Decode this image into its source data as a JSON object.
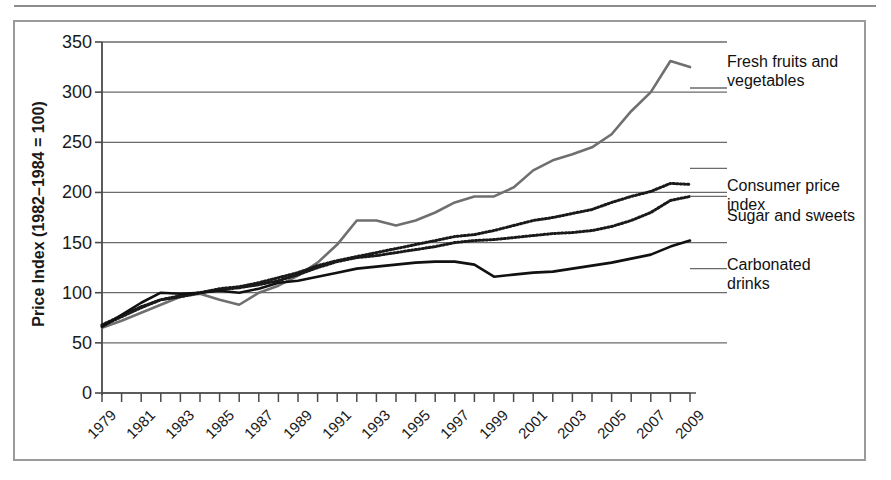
{
  "figure": {
    "name": "food-price-index-line-chart"
  },
  "chart_data": {
    "type": "line",
    "title": "",
    "xlabel": "",
    "ylabel": "Price Index (1982–1984 = 100)",
    "ylim": [
      0,
      350
    ],
    "yticks": [
      0,
      50,
      100,
      150,
      200,
      250,
      300,
      350
    ],
    "ytick_labels": [
      "0",
      "50",
      "100",
      "150",
      "200",
      "250",
      "300",
      "350"
    ],
    "xlim": [
      1979,
      2009
    ],
    "grid": "horizontal",
    "legend_position": "right-inline-labels",
    "x": [
      1979,
      1980,
      1981,
      1982,
      1983,
      1984,
      1985,
      1986,
      1987,
      1988,
      1989,
      1990,
      1991,
      1992,
      1993,
      1994,
      1995,
      1996,
      1997,
      1998,
      1999,
      2000,
      2001,
      2002,
      2003,
      2004,
      2005,
      2006,
      2007,
      2008,
      2009
    ],
    "xtick_labels": [
      "1979",
      "1981",
      "1983",
      "1985",
      "1987",
      "1989",
      "1991",
      "1993",
      "1995",
      "1997",
      "1999",
      "2001",
      "2003",
      "2005",
      "2007",
      "2009"
    ],
    "xtick_values": [
      1979,
      1981,
      1983,
      1985,
      1987,
      1989,
      1991,
      1993,
      1995,
      1997,
      1999,
      2001,
      2003,
      2005,
      2007,
      2009
    ],
    "series": [
      {
        "name": "Fresh fruits and vegetables",
        "label": "Fresh fruits and\nvegetables",
        "style": "solid",
        "color": "#6f6f6f",
        "width": 2.6,
        "values": [
          65,
          72,
          80,
          88,
          96,
          99,
          93,
          88,
          100,
          107,
          117,
          130,
          148,
          172,
          172,
          167,
          172,
          180,
          190,
          196,
          196,
          205,
          222,
          232,
          238,
          245,
          258,
          281,
          300,
          331,
          325
        ]
      },
      {
        "name": "Consumer price index",
        "label": "Consumer price\nindex",
        "style": "dotted",
        "color": "#1a1a1a",
        "width": 3.0,
        "values": [
          68,
          77,
          86,
          93,
          96,
          100,
          104,
          106,
          110,
          115,
          120,
          127,
          132,
          136,
          140,
          144,
          148,
          152,
          156,
          158,
          162,
          167,
          172,
          175,
          179,
          183,
          190,
          196,
          201,
          209,
          208
        ]
      },
      {
        "name": "Sugar and sweets",
        "label": "Sugar and sweets",
        "style": "dotted",
        "color": "#1a1a1a",
        "width": 3.0,
        "values": [
          67,
          76,
          85,
          93,
          97,
          100,
          103,
          105,
          108,
          112,
          118,
          125,
          131,
          135,
          137,
          140,
          143,
          146,
          150,
          152,
          153,
          155,
          157,
          159,
          160,
          162,
          166,
          172,
          180,
          192,
          196
        ]
      },
      {
        "name": "Carbonated drinks",
        "label": "Carbonated\ndrinks",
        "style": "solid",
        "color": "#111111",
        "width": 2.6,
        "values": [
          66,
          78,
          90,
          100,
          99,
          100,
          102,
          100,
          104,
          110,
          112,
          116,
          120,
          124,
          126,
          128,
          130,
          131,
          131,
          128,
          116,
          118,
          120,
          121,
          124,
          127,
          130,
          134,
          138,
          146,
          152
        ]
      }
    ]
  }
}
